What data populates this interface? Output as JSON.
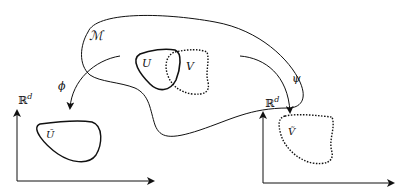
{
  "diagram": {
    "manifold": {
      "label": "ℳ"
    },
    "open_sets": {
      "U": {
        "label": "U",
        "style": "solid"
      },
      "V": {
        "label": "V",
        "style": "dotted"
      }
    },
    "maps": {
      "phi": {
        "label": "ϕ",
        "from": "U",
        "to": "U_tilde"
      },
      "psi": {
        "label": "ψ",
        "from": "V",
        "to": "V_tilde"
      }
    },
    "coordinate_spaces": {
      "left": {
        "axis_label": "ℝ",
        "exponent": "d",
        "image_label": "Ũ",
        "image_style": "solid"
      },
      "right": {
        "axis_label": "ℝ",
        "exponent": "d",
        "image_label": "Ṽ",
        "image_style": "dotted"
      }
    },
    "colors": {
      "stroke": "#111111",
      "background": "#ffffff"
    }
  }
}
